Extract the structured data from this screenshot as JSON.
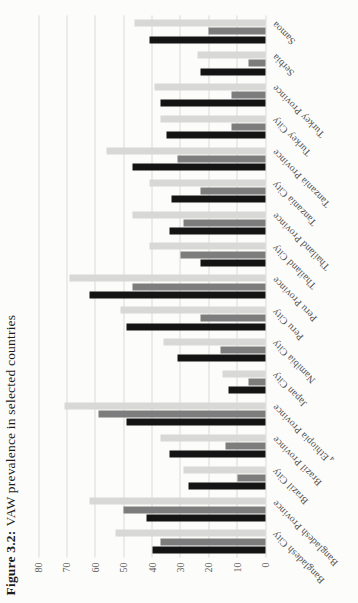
{
  "figure": {
    "label": "Figure 3.2:",
    "title": "VAW prevalence in selected countries"
  },
  "chart_data": {
    "type": "bar",
    "orientation": "vertical grouped bars, whole figure printed rotated 90deg counter-clockwise on page",
    "xlabel": "",
    "ylabel": "",
    "ylim": [
      0,
      80
    ],
    "yticks": [
      0,
      10,
      20,
      30,
      40,
      50,
      60,
      70,
      80
    ],
    "grid": true,
    "legend": "none",
    "categories": [
      "Bangladesh City",
      "Bangladesh Province",
      "Brazil City",
      "Brazil Province",
      "Ethiopia Province",
      "Japan City",
      "Namibia City",
      "Peru City",
      "Peru Province",
      "Thailand City",
      "Thailand Province",
      "Tanzania City",
      "Tanzania Province",
      "Turkey City",
      "Turkey Province",
      "Serbia",
      "Samoa"
    ],
    "footnote_markers": {
      "Ethiopia Province": "4"
    },
    "series": [
      {
        "name": "black",
        "color": "#141414",
        "values": [
          40,
          42,
          27,
          34,
          49,
          13,
          31,
          49,
          62,
          23,
          34,
          33,
          47,
          35,
          37,
          23,
          41
        ]
      },
      {
        "name": "dark-gray",
        "color": "#7d7d7d",
        "values": [
          37,
          50,
          10,
          14,
          59,
          6,
          16,
          23,
          47,
          30,
          29,
          23,
          31,
          12,
          12,
          6,
          20
        ]
      },
      {
        "name": "light-gray",
        "color": "#d8d8d6",
        "values": [
          53,
          62,
          29,
          37,
          71,
          15,
          36,
          51,
          69,
          41,
          47,
          41,
          56,
          37,
          39,
          24,
          46
        ]
      }
    ],
    "colors": {
      "gridline": "#d8dbd9",
      "background": "#fcfcfa",
      "tick_text": "#606060",
      "label_text": "#4f4f4f"
    }
  }
}
